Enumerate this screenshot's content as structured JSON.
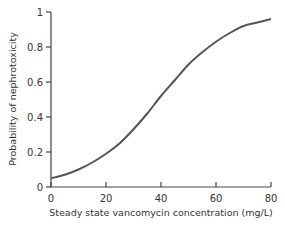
{
  "chart_data": {
    "type": "line",
    "title": "",
    "xlabel": "Steady state vancomycin concentration (mg/L)",
    "ylabel": "Probability of nephrotoxicity",
    "xlim": [
      0,
      80
    ],
    "ylim": [
      0,
      1
    ],
    "xticks": [
      0,
      20,
      40,
      60,
      80
    ],
    "yticks": [
      0,
      0.2,
      0.4,
      0.6,
      0.8,
      1
    ],
    "xtick_labels": [
      "0",
      "20",
      "40",
      "60",
      "80"
    ],
    "ytick_labels": [
      "0",
      "0.2",
      "0.4",
      "0.6",
      "0.8",
      "1"
    ],
    "grid": false,
    "legend": null,
    "series": [
      {
        "name": "Probability of nephrotoxicity",
        "x": [
          0,
          5,
          10,
          15,
          20,
          25,
          30,
          35,
          40,
          45,
          50,
          55,
          60,
          65,
          70,
          75,
          80
        ],
        "values": [
          0.05,
          0.07,
          0.1,
          0.14,
          0.19,
          0.25,
          0.33,
          0.42,
          0.52,
          0.61,
          0.7,
          0.77,
          0.83,
          0.88,
          0.92,
          0.94,
          0.96
        ]
      }
    ],
    "line_color": "#555555"
  }
}
